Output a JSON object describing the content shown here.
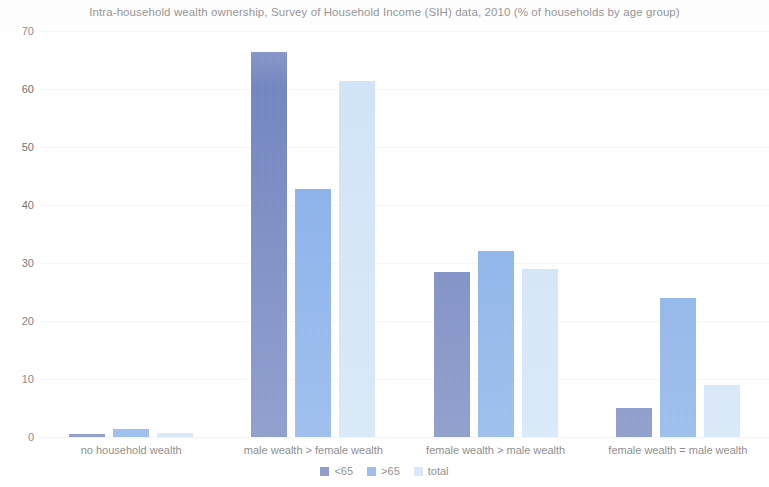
{
  "chart_data": {
    "type": "bar",
    "title": "Intra-household wealth ownership, Survey of Household Income (SIH) data, 2010 (% of households by age group)",
    "xlabel": "",
    "ylabel": "",
    "ylim": [
      0,
      70
    ],
    "yticks": [
      0,
      10,
      20,
      30,
      40,
      50,
      60,
      70
    ],
    "ytick_labels": [
      "0",
      "10",
      "20",
      "30",
      "40",
      "50",
      "60",
      "70"
    ],
    "grid": true,
    "legend_position": "bottom",
    "categories": [
      "no household wealth",
      "male wealth > female wealth",
      "female wealth > male wealth",
      "female wealth = male wealth"
    ],
    "series": [
      {
        "name": "<65",
        "color": "#6c80bd",
        "values": [
          0.6,
          66.3,
          28.4,
          5.0
        ]
      },
      {
        "name": ">65",
        "color": "#7fabe9",
        "values": [
          1.3,
          42.8,
          32.0,
          24.0
        ]
      },
      {
        "name": "total",
        "color": "#cfe3f8",
        "values": [
          0.7,
          61.4,
          29.0,
          8.9
        ]
      }
    ]
  },
  "legend": {
    "items": [
      {
        "label": "<65"
      },
      {
        "label": ">65"
      },
      {
        "label": "total"
      }
    ]
  },
  "colors": {
    "series_under65": "#6c80bd",
    "series_over65": "#7fabe9",
    "series_total": "#cfe3f8",
    "text": "#6e6e6e",
    "background": "#ffffff",
    "gridline": "#f4f6fa"
  }
}
